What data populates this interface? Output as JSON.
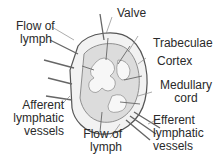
{
  "diagram": {
    "labels": {
      "valve": "Valve",
      "flow_top": [
        "Flow of",
        "lymph"
      ],
      "trabeculae": "Trabeculae",
      "cortex": "Cortex",
      "medullary": [
        "Medullary",
        "cord"
      ],
      "afferent": [
        "Afferent",
        "lymphatic",
        "vessels"
      ],
      "flow_bottom": [
        "Flow of",
        "lymph"
      ],
      "efferent": [
        "Efferent",
        "lymphatic",
        "vessels"
      ]
    },
    "colors": {
      "outline": "#555555",
      "fill": "#e6e6e6",
      "light": "#f4f4f4",
      "text": "#2a2a2a"
    }
  }
}
